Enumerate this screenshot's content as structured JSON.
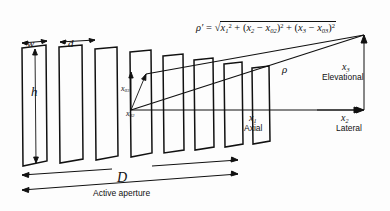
{
  "figure": {
    "background_color": "#fdfdfd",
    "line_color": "#111111"
  },
  "labels": {
    "element_width": "w",
    "element_pitch": "d",
    "element_height": "h",
    "aperture_size": "D",
    "aperture_caption": "Active aperture",
    "source_elevational": "x",
    "source_elevational_sub": "03",
    "source_lateral": "x",
    "source_lateral_sub": "02",
    "distance_rho": "ρ",
    "distance_rho_prime": "ρ′"
  },
  "equation": {
    "lhs": "ρ′",
    "equals": "=",
    "term1_base": "x",
    "term1_sub": "1",
    "term1_sup": "2",
    "plus1": "+",
    "term2_open": "(",
    "term2_var": "x",
    "term2_var_sub": "2",
    "term2_minus": "−",
    "term2_const": "x",
    "term2_const_sub": "02",
    "term2_close": ")",
    "term2_sup": "2",
    "plus2": "+",
    "term3_open": "(",
    "term3_var": "x",
    "term3_var_sub": "3",
    "term3_minus": "−",
    "term3_const": "x",
    "term3_const_sub": "03",
    "term3_close": ")",
    "term3_sup": "2"
  },
  "axes": [
    {
      "symbol": "x",
      "subscript": "1",
      "name": "Axial"
    },
    {
      "symbol": "x",
      "subscript": "2",
      "name": "Lateral"
    },
    {
      "symbol": "x",
      "subscript": "3",
      "name": "Elevational"
    }
  ],
  "array": {
    "element_count": 8,
    "description": "Eight rectangular transducer elements drawn in perspective, narrowing toward the right"
  }
}
